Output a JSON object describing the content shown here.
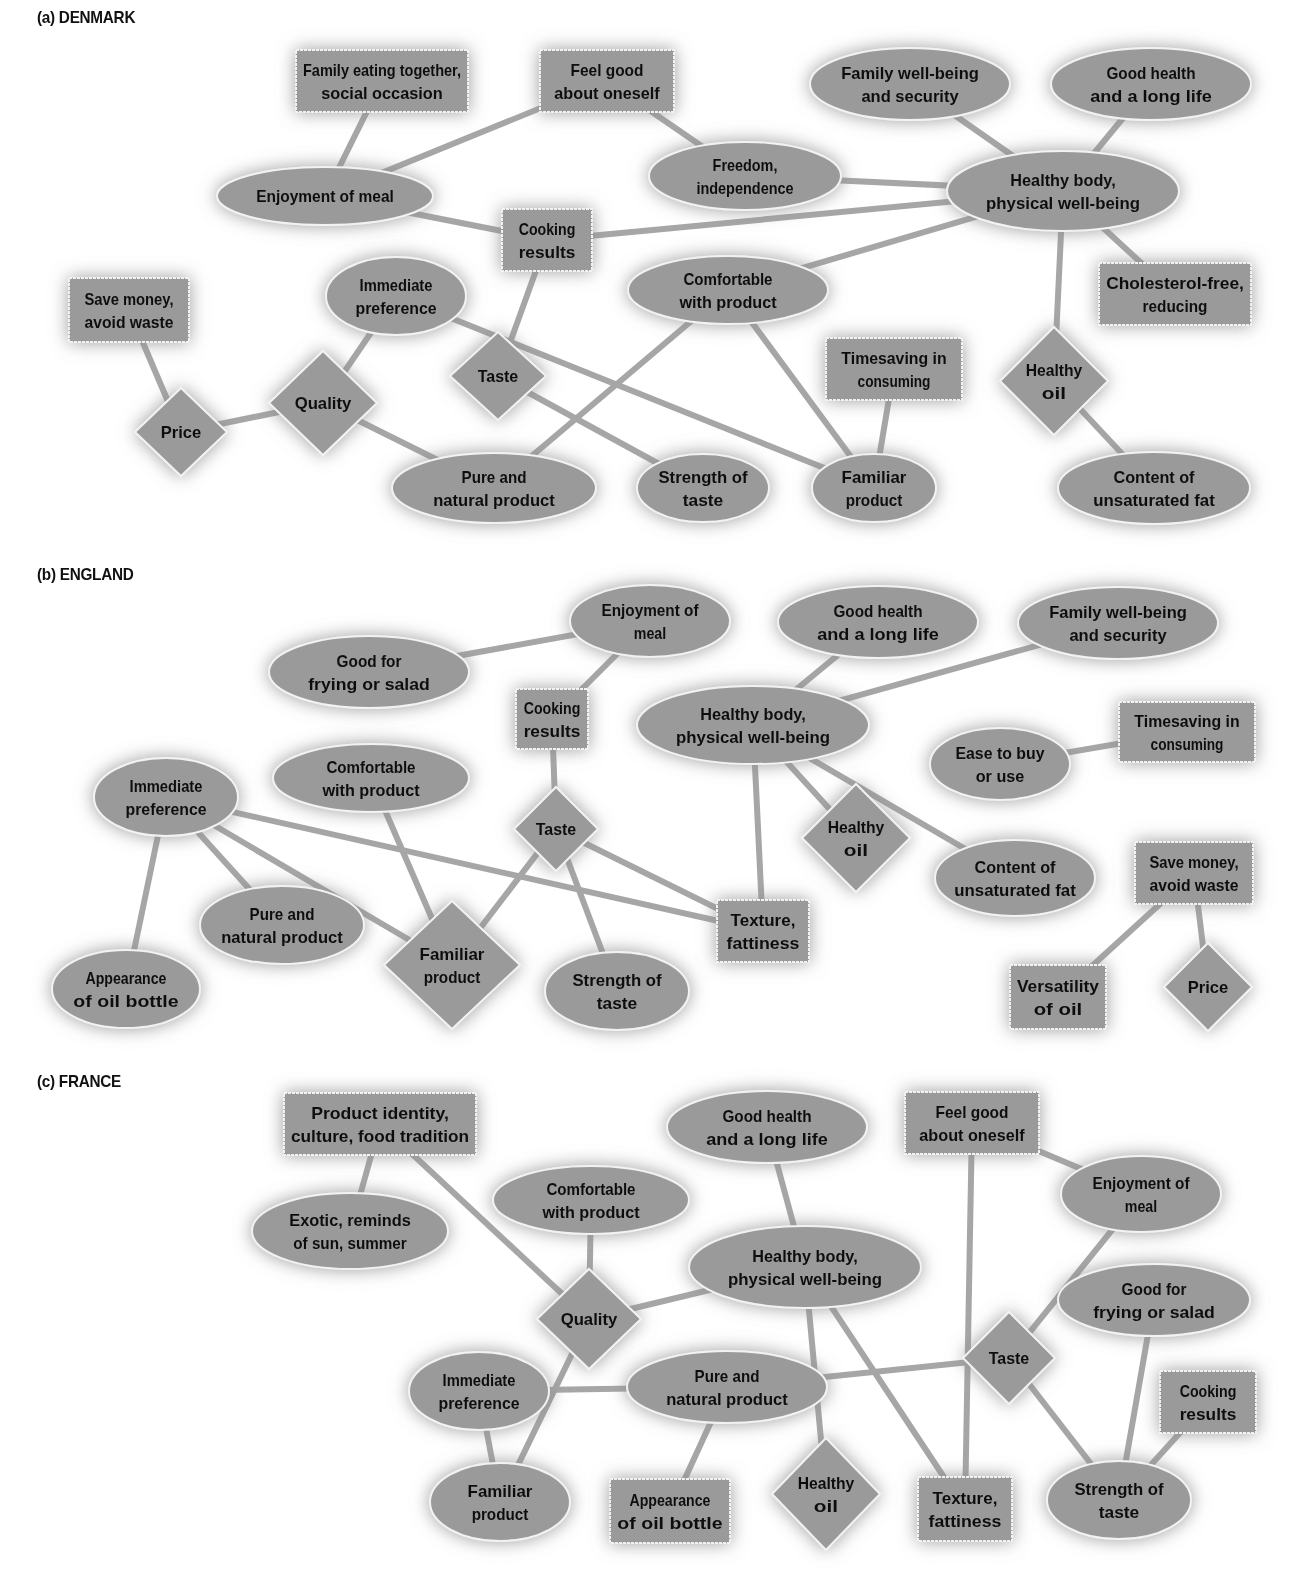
{
  "style": {
    "node_fill": "#9a9a9a",
    "node_stroke": "#f2f2f2",
    "edge_color": "#a6a6a6",
    "glow_color": "#8c8c8c",
    "text_color": "#111111"
  },
  "panels": [
    {
      "id": "denmark",
      "title": "(a) DENMARK",
      "title_y": 8,
      "nodes": [
        {
          "id": "family_eating",
          "shape": "rect",
          "x": 382,
          "y": 81,
          "w": 172,
          "h": 62,
          "lines": [
            "Family eating together,",
            "social occasion"
          ]
        },
        {
          "id": "feel_good",
          "shape": "rect",
          "x": 607,
          "y": 81,
          "w": 134,
          "h": 62,
          "lines": [
            "Feel good",
            "about oneself"
          ]
        },
        {
          "id": "family_wellbeing",
          "shape": "ellipse",
          "x": 910,
          "y": 84,
          "rx": 100,
          "ry": 36,
          "lines": [
            "Family well-being",
            "and security"
          ]
        },
        {
          "id": "good_health",
          "shape": "ellipse",
          "x": 1151,
          "y": 84,
          "rx": 100,
          "ry": 36,
          "lines": [
            "Good health",
            "and a long life"
          ]
        },
        {
          "id": "enjoyment",
          "shape": "ellipse",
          "x": 325,
          "y": 196,
          "rx": 108,
          "ry": 29,
          "lines": [
            "Enjoyment of meal"
          ]
        },
        {
          "id": "freedom",
          "shape": "ellipse",
          "x": 745,
          "y": 176,
          "rx": 96,
          "ry": 34,
          "lines": [
            "Freedom,",
            "independence"
          ]
        },
        {
          "id": "healthy_body",
          "shape": "ellipse",
          "x": 1063,
          "y": 191,
          "rx": 116,
          "ry": 40,
          "lines": [
            "Healthy body,",
            "physical well-being"
          ]
        },
        {
          "id": "cooking_results",
          "shape": "rect",
          "x": 547,
          "y": 240,
          "w": 90,
          "h": 62,
          "lines": [
            "Cooking",
            "results"
          ]
        },
        {
          "id": "immediate_pref",
          "shape": "ellipse",
          "x": 396,
          "y": 296,
          "rx": 70,
          "ry": 39,
          "lines": [
            "Immediate",
            "preference"
          ]
        },
        {
          "id": "comfortable",
          "shape": "ellipse",
          "x": 728,
          "y": 290,
          "rx": 100,
          "ry": 34,
          "lines": [
            "Comfortable",
            "with product"
          ]
        },
        {
          "id": "cholesterol",
          "shape": "rect",
          "x": 1175,
          "y": 294,
          "w": 152,
          "h": 62,
          "lines": [
            "Cholesterol-free,",
            "reducing"
          ]
        },
        {
          "id": "save_money",
          "shape": "rect",
          "x": 129,
          "y": 310,
          "w": 120,
          "h": 64,
          "lines": [
            "Save money,",
            "avoid waste"
          ]
        },
        {
          "id": "timesaving",
          "shape": "rect",
          "x": 894,
          "y": 369,
          "w": 136,
          "h": 62,
          "lines": [
            "Timesaving in",
            "consuming"
          ]
        },
        {
          "id": "taste",
          "shape": "diamond",
          "x": 498,
          "y": 376,
          "rx": 48,
          "ry": 44,
          "lines": [
            "Taste"
          ]
        },
        {
          "id": "healthy_oil",
          "shape": "diamond",
          "x": 1054,
          "y": 381,
          "rx": 54,
          "ry": 54,
          "lines": [
            "Healthy",
            "oil"
          ]
        },
        {
          "id": "quality",
          "shape": "diamond",
          "x": 323,
          "y": 403,
          "rx": 54,
          "ry": 52,
          "lines": [
            "Quality"
          ]
        },
        {
          "id": "price",
          "shape": "diamond",
          "x": 181,
          "y": 432,
          "rx": 46,
          "ry": 44,
          "lines": [
            "Price"
          ]
        },
        {
          "id": "pure_natural",
          "shape": "ellipse",
          "x": 494,
          "y": 488,
          "rx": 102,
          "ry": 35,
          "lines": [
            "Pure and",
            "natural product"
          ]
        },
        {
          "id": "strength",
          "shape": "ellipse",
          "x": 703,
          "y": 488,
          "rx": 66,
          "ry": 34,
          "lines": [
            "Strength of",
            "taste"
          ]
        },
        {
          "id": "familiar",
          "shape": "ellipse",
          "x": 874,
          "y": 488,
          "rx": 62,
          "ry": 34,
          "lines": [
            "Familiar",
            "product"
          ]
        },
        {
          "id": "content_fat",
          "shape": "ellipse",
          "x": 1154,
          "y": 488,
          "rx": 96,
          "ry": 36,
          "lines": [
            "Content of",
            "unsaturated fat"
          ]
        }
      ],
      "edges": [
        [
          "family_eating",
          "enjoyment"
        ],
        [
          "feel_good",
          "enjoyment"
        ],
        [
          "feel_good",
          "freedom"
        ],
        [
          "freedom",
          "healthy_body"
        ],
        [
          "family_wellbeing",
          "healthy_body"
        ],
        [
          "good_health",
          "healthy_body"
        ],
        [
          "enjoyment",
          "cooking_results"
        ],
        [
          "cooking_results",
          "healthy_body"
        ],
        [
          "comfortable",
          "healthy_body"
        ],
        [
          "healthy_body",
          "cholesterol"
        ],
        [
          "healthy_body",
          "healthy_oil"
        ],
        [
          "healthy_oil",
          "content_fat"
        ],
        [
          "cooking_results",
          "taste"
        ],
        [
          "immediate_pref",
          "familiar"
        ],
        [
          "immediate_pref",
          "quality"
        ],
        [
          "save_money",
          "price"
        ],
        [
          "price",
          "quality"
        ],
        [
          "quality",
          "pure_natural"
        ],
        [
          "comfortable",
          "pure_natural"
        ],
        [
          "comfortable",
          "familiar"
        ],
        [
          "taste",
          "strength"
        ],
        [
          "timesaving",
          "familiar"
        ]
      ]
    },
    {
      "id": "england",
      "title": "(b) ENGLAND",
      "title_y": 565,
      "nodes": [
        {
          "id": "enjoyment",
          "shape": "ellipse",
          "x": 650,
          "y": 621,
          "rx": 80,
          "ry": 36,
          "lines": [
            "Enjoyment of",
            "meal"
          ]
        },
        {
          "id": "good_health",
          "shape": "ellipse",
          "x": 878,
          "y": 622,
          "rx": 100,
          "ry": 36,
          "lines": [
            "Good health",
            "and a long life"
          ]
        },
        {
          "id": "family_wellbeing",
          "shape": "ellipse",
          "x": 1118,
          "y": 623,
          "rx": 100,
          "ry": 36,
          "lines": [
            "Family well-being",
            "and security"
          ]
        },
        {
          "id": "good_frying",
          "shape": "ellipse",
          "x": 369,
          "y": 672,
          "rx": 100,
          "ry": 36,
          "lines": [
            "Good for",
            "frying or salad"
          ]
        },
        {
          "id": "cooking_results",
          "shape": "rect",
          "x": 552,
          "y": 719,
          "w": 72,
          "h": 60,
          "lines": [
            "Cooking",
            "results"
          ]
        },
        {
          "id": "healthy_body",
          "shape": "ellipse",
          "x": 753,
          "y": 725,
          "rx": 116,
          "ry": 39,
          "lines": [
            "Healthy body,",
            "physical well-being"
          ]
        },
        {
          "id": "timesaving",
          "shape": "rect",
          "x": 1187,
          "y": 732,
          "w": 136,
          "h": 60,
          "lines": [
            "Timesaving in",
            "consuming"
          ]
        },
        {
          "id": "ease_buy",
          "shape": "ellipse",
          "x": 1000,
          "y": 764,
          "rx": 70,
          "ry": 36,
          "lines": [
            "Ease to buy",
            "or use"
          ]
        },
        {
          "id": "comfortable",
          "shape": "ellipse",
          "x": 371,
          "y": 778,
          "rx": 98,
          "ry": 34,
          "lines": [
            "Comfortable",
            "with product"
          ]
        },
        {
          "id": "immediate_pref",
          "shape": "ellipse",
          "x": 166,
          "y": 797,
          "rx": 72,
          "ry": 39,
          "lines": [
            "Immediate",
            "preference"
          ]
        },
        {
          "id": "taste",
          "shape": "diamond",
          "x": 556,
          "y": 829,
          "rx": 42,
          "ry": 42,
          "lines": [
            "Taste"
          ]
        },
        {
          "id": "healthy_oil",
          "shape": "diamond",
          "x": 856,
          "y": 838,
          "rx": 54,
          "ry": 54,
          "lines": [
            "Healthy",
            "oil"
          ]
        },
        {
          "id": "content_fat",
          "shape": "ellipse",
          "x": 1015,
          "y": 878,
          "rx": 80,
          "ry": 38,
          "lines": [
            "Content of",
            "unsaturated fat"
          ]
        },
        {
          "id": "save_money",
          "shape": "rect",
          "x": 1194,
          "y": 873,
          "w": 118,
          "h": 62,
          "lines": [
            "Save money,",
            "avoid waste"
          ]
        },
        {
          "id": "pure_natural",
          "shape": "ellipse",
          "x": 282,
          "y": 925,
          "rx": 82,
          "ry": 39,
          "lines": [
            "Pure and",
            "natural product"
          ]
        },
        {
          "id": "texture",
          "shape": "rect",
          "x": 763,
          "y": 931,
          "w": 92,
          "h": 62,
          "lines": [
            "Texture,",
            "fattiness"
          ]
        },
        {
          "id": "familiar",
          "shape": "diamond",
          "x": 452,
          "y": 965,
          "rx": 68,
          "ry": 64,
          "lines": [
            "Familiar",
            "product"
          ]
        },
        {
          "id": "strength",
          "shape": "ellipse",
          "x": 617,
          "y": 991,
          "rx": 72,
          "ry": 39,
          "lines": [
            "Strength of",
            "taste"
          ]
        },
        {
          "id": "appearance",
          "shape": "ellipse",
          "x": 126,
          "y": 989,
          "rx": 74,
          "ry": 39,
          "lines": [
            "Appearance",
            "of oil bottle"
          ]
        },
        {
          "id": "versatility",
          "shape": "rect",
          "x": 1058,
          "y": 997,
          "w": 96,
          "h": 64,
          "lines": [
            "Versatility",
            "of oil"
          ]
        },
        {
          "id": "price",
          "shape": "diamond",
          "x": 1208,
          "y": 987,
          "rx": 44,
          "ry": 44,
          "lines": [
            "Price"
          ]
        }
      ],
      "edges": [
        [
          "good_frying",
          "enjoyment"
        ],
        [
          "enjoyment",
          "cooking_results"
        ],
        [
          "good_health",
          "healthy_body"
        ],
        [
          "family_wellbeing",
          "healthy_body"
        ],
        [
          "ease_buy",
          "timesaving"
        ],
        [
          "cooking_results",
          "taste"
        ],
        [
          "healthy_body",
          "healthy_oil"
        ],
        [
          "healthy_body",
          "content_fat"
        ],
        [
          "healthy_body",
          "texture"
        ],
        [
          "immediate_pref",
          "appearance"
        ],
        [
          "immediate_pref",
          "pure_natural"
        ],
        [
          "immediate_pref",
          "familiar"
        ],
        [
          "immediate_pref",
          "texture"
        ],
        [
          "comfortable",
          "familiar"
        ],
        [
          "taste",
          "familiar"
        ],
        [
          "taste",
          "strength"
        ],
        [
          "taste",
          "texture"
        ],
        [
          "save_money",
          "versatility"
        ],
        [
          "save_money",
          "price"
        ]
      ]
    },
    {
      "id": "france",
      "title": "(c) FRANCE",
      "title_y": 1072,
      "nodes": [
        {
          "id": "product_identity",
          "shape": "rect",
          "x": 380,
          "y": 1124,
          "w": 192,
          "h": 62,
          "lines": [
            "Product identity,",
            "culture, food tradition"
          ]
        },
        {
          "id": "good_health",
          "shape": "ellipse",
          "x": 767,
          "y": 1127,
          "rx": 100,
          "ry": 36,
          "lines": [
            "Good health",
            "and a long life"
          ]
        },
        {
          "id": "feel_good",
          "shape": "rect",
          "x": 972,
          "y": 1123,
          "w": 134,
          "h": 62,
          "lines": [
            "Feel good",
            "about oneself"
          ]
        },
        {
          "id": "enjoyment",
          "shape": "ellipse",
          "x": 1141,
          "y": 1194,
          "rx": 80,
          "ry": 38,
          "lines": [
            "Enjoyment of",
            "meal"
          ]
        },
        {
          "id": "comfortable",
          "shape": "ellipse",
          "x": 591,
          "y": 1200,
          "rx": 98,
          "ry": 34,
          "lines": [
            "Comfortable",
            "with product"
          ]
        },
        {
          "id": "exotic",
          "shape": "ellipse",
          "x": 350,
          "y": 1231,
          "rx": 98,
          "ry": 38,
          "lines": [
            "Exotic, reminds",
            "of sun, summer"
          ]
        },
        {
          "id": "healthy_body",
          "shape": "ellipse",
          "x": 805,
          "y": 1267,
          "rx": 116,
          "ry": 41,
          "lines": [
            "Healthy body,",
            "physical well-being"
          ]
        },
        {
          "id": "good_frying",
          "shape": "ellipse",
          "x": 1154,
          "y": 1300,
          "rx": 96,
          "ry": 36,
          "lines": [
            "Good for",
            "frying or salad"
          ]
        },
        {
          "id": "quality",
          "shape": "diamond",
          "x": 589,
          "y": 1319,
          "rx": 52,
          "ry": 50,
          "lines": [
            "Quality"
          ]
        },
        {
          "id": "taste",
          "shape": "diamond",
          "x": 1009,
          "y": 1358,
          "rx": 46,
          "ry": 46,
          "lines": [
            "Taste"
          ]
        },
        {
          "id": "pure_natural",
          "shape": "ellipse",
          "x": 727,
          "y": 1387,
          "rx": 100,
          "ry": 36,
          "lines": [
            "Pure and",
            "natural product"
          ]
        },
        {
          "id": "immediate_pref",
          "shape": "ellipse",
          "x": 479,
          "y": 1391,
          "rx": 70,
          "ry": 39,
          "lines": [
            "Immediate",
            "preference"
          ]
        },
        {
          "id": "cooking_results",
          "shape": "rect",
          "x": 1208,
          "y": 1402,
          "w": 96,
          "h": 62,
          "lines": [
            "Cooking",
            "results"
          ]
        },
        {
          "id": "familiar",
          "shape": "ellipse",
          "x": 500,
          "y": 1502,
          "rx": 70,
          "ry": 39,
          "lines": [
            "Familiar",
            "product"
          ]
        },
        {
          "id": "appearance",
          "shape": "rect",
          "x": 670,
          "y": 1511,
          "w": 120,
          "h": 64,
          "lines": [
            "Appearance",
            "of oil bottle"
          ]
        },
        {
          "id": "healthy_oil",
          "shape": "diamond",
          "x": 826,
          "y": 1494,
          "rx": 54,
          "ry": 56,
          "lines": [
            "Healthy",
            "oil"
          ]
        },
        {
          "id": "texture",
          "shape": "rect",
          "x": 965,
          "y": 1509,
          "w": 94,
          "h": 64,
          "lines": [
            "Texture,",
            "fattiness"
          ]
        },
        {
          "id": "strength",
          "shape": "ellipse",
          "x": 1119,
          "y": 1500,
          "rx": 72,
          "ry": 39,
          "lines": [
            "Strength of",
            "taste"
          ]
        }
      ],
      "edges": [
        [
          "product_identity",
          "exotic"
        ],
        [
          "product_identity",
          "quality"
        ],
        [
          "good_health",
          "healthy_body"
        ],
        [
          "feel_good",
          "enjoyment"
        ],
        [
          "feel_good",
          "texture"
        ],
        [
          "enjoyment",
          "taste"
        ],
        [
          "comfortable",
          "quality"
        ],
        [
          "quality",
          "healthy_body"
        ],
        [
          "quality",
          "familiar"
        ],
        [
          "immediate_pref",
          "pure_natural"
        ],
        [
          "immediate_pref",
          "familiar"
        ],
        [
          "pure_natural",
          "appearance"
        ],
        [
          "pure_natural",
          "taste"
        ],
        [
          "healthy_body",
          "healthy_oil"
        ],
        [
          "healthy_body",
          "texture"
        ],
        [
          "taste",
          "strength"
        ],
        [
          "good_frying",
          "strength"
        ],
        [
          "cooking_results",
          "strength"
        ]
      ]
    }
  ]
}
